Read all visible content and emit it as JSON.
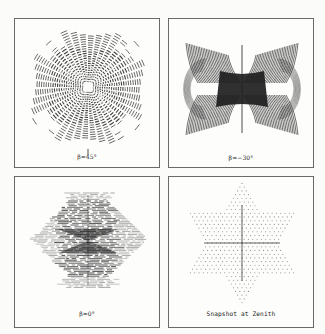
{
  "figure": {
    "panels": [
      {
        "id": "tl",
        "caption": "β=45°",
        "pattern": "rings-clover",
        "box": {
          "left": 14,
          "top": 18,
          "width": 146,
          "height": 150
        },
        "center": [
          73,
          68
        ],
        "caption_y": 134
      },
      {
        "id": "tr",
        "caption": "β=−30°",
        "pattern": "bowtie-arcs",
        "box": {
          "left": 168,
          "top": 18,
          "width": 146,
          "height": 150
        },
        "center": [
          73,
          70
        ],
        "caption_y": 135
      },
      {
        "id": "bl",
        "caption": "β=0°",
        "pattern": "horizontal-hatch",
        "box": {
          "left": 14,
          "top": 176,
          "width": 146,
          "height": 152
        },
        "center": [
          73,
          62
        ],
        "caption_y": 133
      },
      {
        "id": "br",
        "caption": "Snapshot at Zenith",
        "pattern": "hexagram-dots",
        "box": {
          "left": 168,
          "top": 176,
          "width": 146,
          "height": 152
        },
        "center": [
          73,
          66
        ],
        "caption_y": 133
      }
    ],
    "colors": {
      "ink": "#1e1e1e",
      "border": "#6a6a6a",
      "dots": "#8a8a8a",
      "background": "#fdfdfc"
    }
  }
}
